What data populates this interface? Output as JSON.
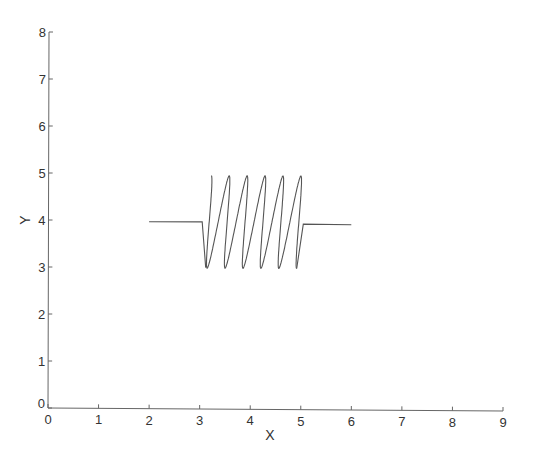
{
  "chart_data": {
    "type": "line",
    "title": "",
    "xlabel": "X",
    "ylabel": "Y",
    "xlim": [
      0,
      9
    ],
    "ylim": [
      0,
      8
    ],
    "xticks": [
      0,
      1,
      2,
      3,
      4,
      5,
      6,
      7,
      8,
      9
    ],
    "yticks": [
      0,
      1,
      2,
      3,
      4,
      5,
      6,
      7,
      8
    ],
    "grid": false,
    "legend": null,
    "series": [
      {
        "name": "coil",
        "color": "#555555",
        "description": "Coil (inductor/spring) shape: horizontal lead at y=4 from x=2 to x=3.05, five loops between x=3.1 and x=5.15 oscillating between y=3 and y=4.95, then lead back at y=3.95 to x=6",
        "left_lead": [
          [
            2.0,
            3.97
          ],
          [
            3.05,
            3.97
          ]
        ],
        "right_lead": [
          [
            5.05,
            3.93
          ],
          [
            6.0,
            3.92
          ]
        ],
        "coil": {
          "x_start": 3.1,
          "x_end": 5.05,
          "y_center": 3.97,
          "amplitude": 0.98,
          "loops": 5,
          "loop_radius_x": 0.13
        },
        "peaks_x": [
          3.25,
          3.55,
          4.0,
          4.5,
          4.95,
          5.15
        ],
        "peak_y": 4.95,
        "troughs_x": [
          3.3,
          3.75,
          4.25,
          4.75,
          5.1
        ],
        "trough_y": 3.0
      }
    ]
  },
  "axes": {
    "x_tick_labels": [
      "0",
      "1",
      "2",
      "3",
      "4",
      "5",
      "6",
      "7",
      "8",
      "9"
    ],
    "y_tick_labels": [
      "0",
      "1",
      "2",
      "3",
      "4",
      "5",
      "6",
      "7",
      "8"
    ],
    "x_label": "X",
    "y_label": "Y",
    "axis_color": "#555555"
  }
}
